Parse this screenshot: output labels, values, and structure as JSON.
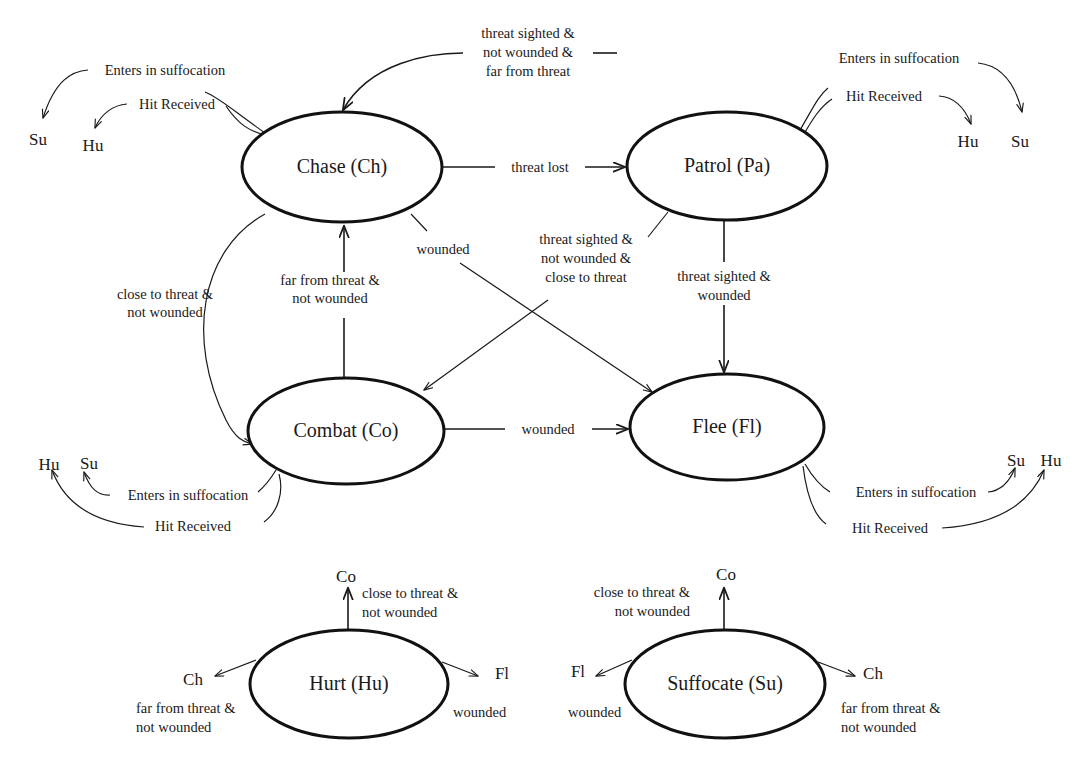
{
  "diagram": {
    "type": "finite-state-machine",
    "title": "",
    "states": [
      {
        "id": "Ch",
        "label": "Chase (Ch)",
        "cx": 342,
        "cy": 167,
        "rx": 100,
        "ry": 55
      },
      {
        "id": "Pa",
        "label": "Patrol (Pa)",
        "cx": 727,
        "cy": 166,
        "rx": 100,
        "ry": 54
      },
      {
        "id": "Co",
        "label": "Combat (Co)",
        "cx": 346,
        "cy": 431,
        "rx": 98,
        "ry": 53
      },
      {
        "id": "Fl",
        "label": "Flee (Fl)",
        "cx": 727,
        "cy": 427,
        "rx": 97,
        "ry": 53
      },
      {
        "id": "Hu",
        "label": "Hurt (Hu)",
        "cx": 349,
        "cy": 684,
        "rx": 99,
        "ry": 54
      },
      {
        "id": "Su",
        "label": "Suffocate (Su)",
        "cx": 725,
        "cy": 684,
        "rx": 100,
        "ry": 54
      }
    ],
    "transitions": [
      {
        "from": "Ch",
        "to": "Pa",
        "label": "threat lost"
      },
      {
        "from": "Pa",
        "to": "Ch",
        "label": "threat sighted &\nnot wounded &\nfar from threat"
      },
      {
        "from": "Ch",
        "to": "Co",
        "label": "close to threat &\nnot wounded"
      },
      {
        "from": "Co",
        "to": "Ch",
        "label": "far from threat &\nnot wounded"
      },
      {
        "from": "Ch",
        "to": "Fl",
        "label": "wounded"
      },
      {
        "from": "Pa",
        "to": "Co",
        "label": "threat sighted &\nnot wounded &\nclose to threat"
      },
      {
        "from": "Pa",
        "to": "Fl",
        "label": "threat sighted &\nwounded"
      },
      {
        "from": "Co",
        "to": "Fl",
        "label": "wounded"
      },
      {
        "from": "Ch",
        "to": "Su",
        "label": "Enters in suffocation"
      },
      {
        "from": "Ch",
        "to": "Hu",
        "label": "Hit Received"
      },
      {
        "from": "Pa",
        "to": "Su",
        "label": "Enters in suffocation"
      },
      {
        "from": "Pa",
        "to": "Hu",
        "label": "Hit Received"
      },
      {
        "from": "Co",
        "to": "Su",
        "label": "Enters in suffocation"
      },
      {
        "from": "Co",
        "to": "Hu",
        "label": "Hit Received"
      },
      {
        "from": "Fl",
        "to": "Su",
        "label": "Enters in suffocation"
      },
      {
        "from": "Fl",
        "to": "Hu",
        "label": "Hit Received"
      },
      {
        "from": "Hu",
        "to": "Co",
        "label": "close to threat &\nnot wounded"
      },
      {
        "from": "Hu",
        "to": "Ch",
        "label": "far from threat &\nnot wounded"
      },
      {
        "from": "Hu",
        "to": "Fl",
        "label": "wounded"
      },
      {
        "from": "Su",
        "to": "Co",
        "label": "close to threat &\nnot wounded"
      },
      {
        "from": "Su",
        "to": "Ch",
        "label": "far from threat &\nnot wounded"
      },
      {
        "from": "Su",
        "to": "Fl",
        "label": "wounded"
      }
    ],
    "labels": {
      "state_chase": "Chase (Ch)",
      "state_patrol": "Patrol (Pa)",
      "state_combat": "Combat (Co)",
      "state_flee": "Flee (Fl)",
      "state_hurt": "Hurt (Hu)",
      "state_suffocate": "Suffocate (Su)",
      "threat_lost": "threat lost",
      "wounded": "wounded",
      "hit_received": "Hit Received",
      "enters_in_suffocation": "Enters in suffocation",
      "ts_nw_far_1": "threat sighted &",
      "ts_nw_far_2": "not wounded &",
      "ts_nw_far_3": "far from threat",
      "ts_nw_close_1": "threat sighted &",
      "ts_nw_close_2": "not wounded &",
      "ts_nw_close_3": "close to threat",
      "ts_w_1": "threat sighted &",
      "ts_w_2": "wounded",
      "close_nw_1": "close to threat &",
      "close_nw_2": "not wounded",
      "far_nw_1": "far from threat &",
      "far_nw_2": "not wounded",
      "stub_su": "Su",
      "stub_hu": "Hu",
      "stub_ch": "Ch",
      "stub_co": "Co",
      "stub_fl": "Fl"
    },
    "colors": {
      "background": "#ffffff",
      "stroke": "#1a1a1a",
      "state_outline": "#111111",
      "text": "#1a1a1a"
    }
  }
}
